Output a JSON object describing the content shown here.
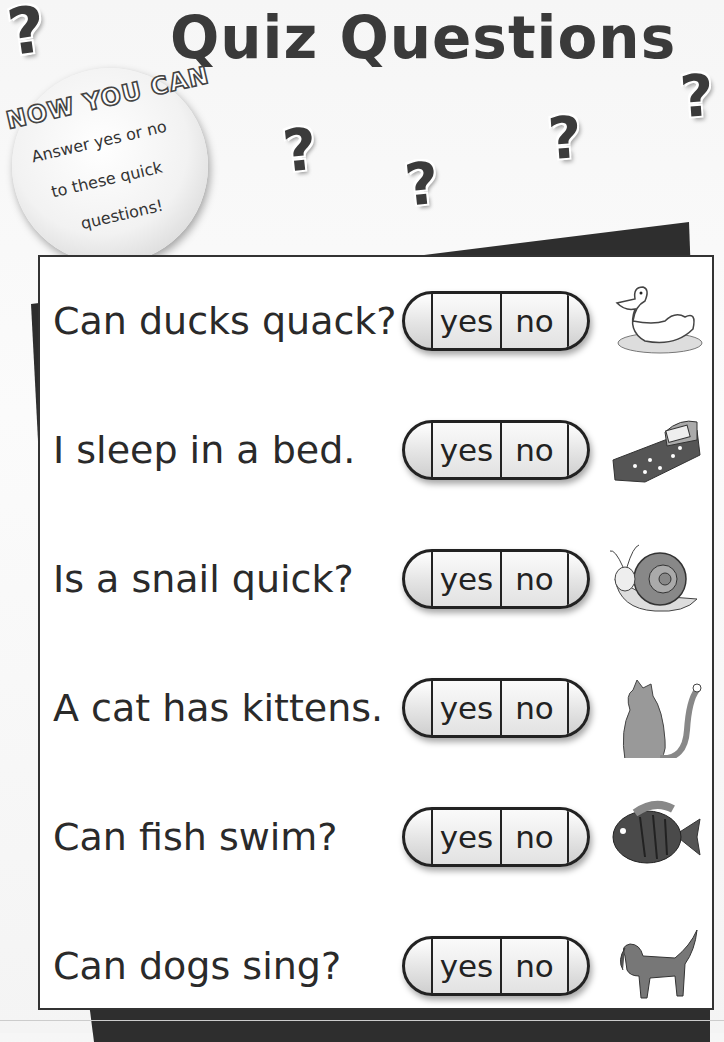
{
  "header": {
    "title": "Quiz Questions"
  },
  "badge": {
    "heading": "NOW YOU CAN",
    "lines": [
      "Answer yes or no",
      "to these quick",
      "questions!"
    ]
  },
  "decorations": {
    "question_mark": "?"
  },
  "questions": [
    {
      "text": "Can ducks quack?",
      "yes": "yes",
      "no": "no",
      "picture": "duck"
    },
    {
      "text": "I sleep in a bed.",
      "yes": "yes",
      "no": "no",
      "picture": "bed"
    },
    {
      "text": "Is a snail quick?",
      "yes": "yes",
      "no": "no",
      "picture": "snail"
    },
    {
      "text": "A cat has kittens.",
      "yes": "yes",
      "no": "no",
      "picture": "cat"
    },
    {
      "text": "Can fish swim?",
      "yes": "yes",
      "no": "no",
      "picture": "fish"
    },
    {
      "text": "Can dogs sing?",
      "yes": "yes",
      "no": "no",
      "picture": "dog"
    }
  ]
}
